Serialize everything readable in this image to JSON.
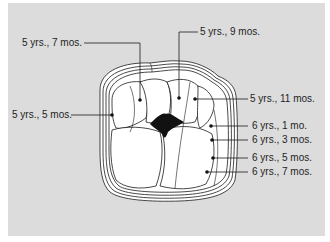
{
  "diagram": {
    "title": "",
    "background_color": "#dcdcdc",
    "labels": [
      {
        "id": "5y5m",
        "text": "5 yrs., 5 mos.",
        "side": "left"
      },
      {
        "id": "5y7m",
        "text": "5 yrs., 7 mos.",
        "side": "left"
      },
      {
        "id": "5y9m",
        "text": "5 yrs., 9 mos.",
        "side": "right"
      },
      {
        "id": "5y11m",
        "text": "5 yrs., 11 mos.",
        "side": "right"
      },
      {
        "id": "6y1m",
        "text": "6 yrs., 1 mo.",
        "side": "right"
      },
      {
        "id": "6y3m",
        "text": "6 yrs., 3 mos.",
        "side": "right"
      },
      {
        "id": "6y5m",
        "text": "6 yrs., 5 mos.",
        "side": "right"
      },
      {
        "id": "6y7m",
        "text": "6 yrs., 7 mos.",
        "side": "right"
      }
    ]
  }
}
